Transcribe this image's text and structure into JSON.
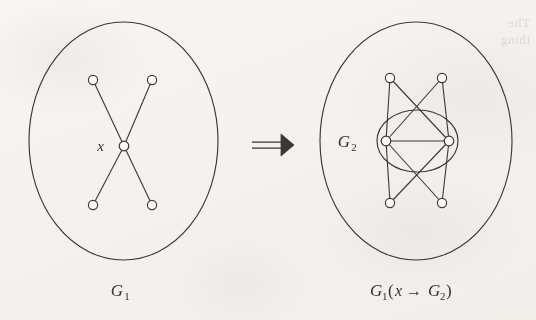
{
  "figure": {
    "kind": "graph-substitution-diagram",
    "background_color": "#f6f4f1",
    "ink_color": "#3a3733",
    "node_fill": "#fbfaf8",
    "relation_symbol": "⟹",
    "bleed_through_text_line1": "The",
    "bleed_through_text_line2": "thing"
  },
  "left_graph": {
    "label_base": "G",
    "label_sub": "1",
    "vertex_label": "x",
    "description": "star K(1,4) with centre x inside an ellipse",
    "boundary": {
      "cx": 123.5,
      "cy": 141,
      "rx": 94.5,
      "ry": 119
    },
    "nodes": [
      {
        "name": "leaf-top-left",
        "x": 93,
        "y": 80
      },
      {
        "name": "leaf-top-right",
        "x": 152,
        "y": 80
      },
      {
        "name": "centre-x",
        "x": 124,
        "y": 146
      },
      {
        "name": "leaf-bottom-left",
        "x": 93,
        "y": 205
      },
      {
        "name": "leaf-bottom-right",
        "x": 152,
        "y": 205
      }
    ],
    "edges": [
      [
        "centre-x",
        "leaf-top-left"
      ],
      [
        "centre-x",
        "leaf-top-right"
      ],
      [
        "centre-x",
        "leaf-bottom-left"
      ],
      [
        "centre-x",
        "leaf-bottom-right"
      ]
    ],
    "vertex_label_position": {
      "x": 104,
      "y": 151
    },
    "caption_position": {
      "x": 124,
      "y": 296
    }
  },
  "right_graph": {
    "label_base": "G",
    "label_sub": "1",
    "arg_open": "(",
    "arg_vertex": "x",
    "arg_arrow": "→",
    "arg_base": "G",
    "arg_sub": "2",
    "arg_close": ")",
    "inner_label_base": "G",
    "inner_label_sub": "2",
    "description": "G1 with x replaced by G2: every outer vertex joined to both vertices of G2",
    "boundary": {
      "cx": 416,
      "cy": 141,
      "rx": 96,
      "ry": 119
    },
    "inner_boundary": {
      "cx": 417.5,
      "cy": 141,
      "rx": 40.5,
      "ry": 31
    },
    "nodes": [
      {
        "name": "outer-top-left",
        "x": 390,
        "y": 78
      },
      {
        "name": "outer-top-right",
        "x": 442,
        "y": 78
      },
      {
        "name": "g2-left",
        "x": 386,
        "y": 141
      },
      {
        "name": "g2-right",
        "x": 449,
        "y": 141
      },
      {
        "name": "outer-bottom-left",
        "x": 390,
        "y": 203
      },
      {
        "name": "outer-bottom-right",
        "x": 442,
        "y": 203
      }
    ],
    "edges": [
      [
        "g2-left",
        "g2-right"
      ],
      [
        "outer-top-left",
        "g2-left"
      ],
      [
        "outer-top-left",
        "g2-right"
      ],
      [
        "outer-top-right",
        "g2-left"
      ],
      [
        "outer-top-right",
        "g2-right"
      ],
      [
        "outer-bottom-left",
        "g2-left"
      ],
      [
        "outer-bottom-left",
        "g2-right"
      ],
      [
        "outer-bottom-right",
        "g2-left"
      ],
      [
        "outer-bottom-right",
        "g2-right"
      ]
    ],
    "inner_label_position": {
      "x": 350,
      "y": 147
    },
    "caption_position": {
      "x": 416,
      "y": 296
    }
  },
  "relation": {
    "symbol": "⟹",
    "position": {
      "x": 272,
      "y": 145
    }
  }
}
